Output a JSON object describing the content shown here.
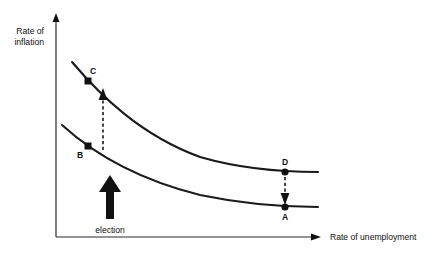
{
  "figure": {
    "background_color": "#ffffff",
    "ink_color": "#111111"
  },
  "axes": {
    "y_label_line1": "Rate of",
    "y_label_line2": "inflation",
    "x_label": "Rate of unemployment",
    "origin": {
      "x": 56,
      "y": 237
    },
    "y_top": 14,
    "x_right": 320
  },
  "points": [
    {
      "id": "C",
      "label": "C",
      "x": 88,
      "y": 81,
      "marker": "square",
      "curve": "upper"
    },
    {
      "id": "B",
      "label": "B",
      "x": 88,
      "y": 146,
      "marker": "square",
      "curve": "lower"
    },
    {
      "id": "D",
      "label": "D",
      "x": 285,
      "y": 172,
      "marker": "dot",
      "curve": "upper"
    },
    {
      "id": "A",
      "label": "A",
      "x": 285,
      "y": 207,
      "marker": "dot",
      "curve": "lower"
    }
  ],
  "curves": [
    {
      "name": "upper-phillips-curve",
      "description": "Short-run Phillips curve after inflation expectations rise",
      "path": "M 72 62 C 100 95, 140 135, 200 157 C 245 170, 285 172, 318 172"
    },
    {
      "name": "lower-phillips-curve",
      "description": "Initial short-run Phillips curve",
      "path": "M 62 125 C 95 155, 140 180, 200 195 C 243 204, 285 207, 318 207"
    }
  ],
  "annotations": {
    "up_arrow": {
      "name": "b-to-c-transition",
      "from": {
        "x": 103,
        "y": 150
      },
      "to": {
        "x": 103,
        "y": 92
      },
      "style": "dashed",
      "direction": "up"
    },
    "down_arrow": {
      "name": "d-to-a-transition",
      "from": {
        "x": 285,
        "y": 176
      },
      "to": {
        "x": 285,
        "y": 203
      },
      "style": "dashed",
      "direction": "down"
    },
    "election_arrow": {
      "name": "election-shock-arrow",
      "label": "election",
      "x": 110,
      "tail_y": 218,
      "head_y": 178,
      "style": "solid-thick",
      "direction": "up"
    }
  }
}
